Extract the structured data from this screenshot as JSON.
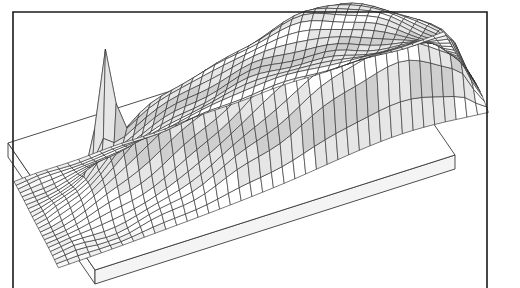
{
  "figure": {
    "type": "3d-surface-mesh",
    "title": "",
    "subtitle": "",
    "background_color": "#ffffff",
    "frame": {
      "visible": true,
      "color": "#1a1a1a",
      "line_width": 1.6,
      "left_x": 13,
      "right_x": 487,
      "top_y": 12,
      "bottom_open": true,
      "description": "thin rectangular border, open at the bottom"
    },
    "base_plate": {
      "visible": true,
      "thickness_px": 14,
      "top_face_color": "#ffffff",
      "front_face_color": "#f4f4f4",
      "side_face_color": "#fbfbfb",
      "edge_color": "#3a3a3a",
      "corners": {
        "left": [
          8,
          143
        ],
        "front": [
          95,
          270
        ],
        "right": [
          455,
          155
        ],
        "back": [
          368,
          28
        ]
      }
    },
    "mesh": {
      "wire_color": "#2a2a2a",
      "wire_width": 0.62,
      "fill_light": "#ffffff",
      "fill_mid": "#e6e6e6",
      "fill_dark": "#cfcfcf",
      "grid_rows": 22,
      "grid_cols": 40,
      "shading": "grayscale contour bands",
      "hidden_line_removal": true
    },
    "projection": {
      "kind": "oblique-axonometric",
      "origin_x": 14,
      "origin_y": 182,
      "u_step_x": 10.75,
      "u_step_y": -3.72,
      "v_step_x": 2.02,
      "v_step_y": 3.9,
      "z_scale": 1.0
    }
  },
  "chart_data": {
    "type": "surface",
    "title": "",
    "xlabel": "",
    "ylabel": "",
    "zlabel": "",
    "grid": true,
    "legend": null,
    "axis_ticks_visible": false,
    "x_count": 41,
    "y_count": 23,
    "xlim": [
      0,
      40
    ],
    "ylim": [
      0,
      22
    ],
    "zlim": [
      0,
      100
    ],
    "features": [
      {
        "name": "sharp-spike",
        "label": "narrow tall spike",
        "x": 7,
        "y": 8,
        "height": 100,
        "width": 2.0,
        "screen_xy": [
          115,
          95
        ]
      },
      {
        "name": "left-ridge",
        "label": "broad low ridge left of center",
        "x": 11,
        "y": 10,
        "height": 46,
        "width": 6.0,
        "screen_xy": [
          175,
          120
        ]
      },
      {
        "name": "central-plateau",
        "label": "long central plateau ridge",
        "x": 20,
        "y": 11,
        "height": 58,
        "width": 9.0,
        "screen_xy": [
          250,
          105
        ]
      },
      {
        "name": "main-dome",
        "label": "large rounded dome toward the back right",
        "x": 28,
        "y": 13,
        "height": 74,
        "width": 11.0,
        "screen_xy": [
          330,
          72
        ]
      },
      {
        "name": "back-shoulder",
        "label": "rising shoulder along back edge",
        "x": 33,
        "y": 18,
        "height": 50,
        "width": 9.0,
        "screen_xy": [
          392,
          52
        ]
      },
      {
        "name": "front-flat",
        "label": "flat near-zero plain across the front half",
        "x": 20,
        "y": 3,
        "height": 2,
        "width": 30.0,
        "screen_xy": [
          250,
          215
        ]
      }
    ]
  }
}
